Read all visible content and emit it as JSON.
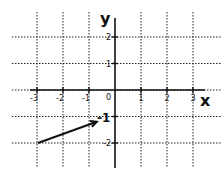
{
  "diagram": {
    "x_axis_label": "x",
    "y_axis_label": "y",
    "x_ticks": [
      "-3",
      "-2",
      "-1",
      "0",
      "1",
      "2",
      "3"
    ],
    "y_ticks_labels": {
      "2": "2",
      "1": "1",
      "-1": "-1",
      "-2": "-2"
    },
    "origin_label": "0",
    "x_range": [
      -3,
      3
    ],
    "y_range": [
      -2,
      2
    ],
    "vector": {
      "from": [
        -3,
        -2
      ],
      "to": [
        -0.7,
        -1.2
      ]
    },
    "highlight_label": "-1"
  }
}
